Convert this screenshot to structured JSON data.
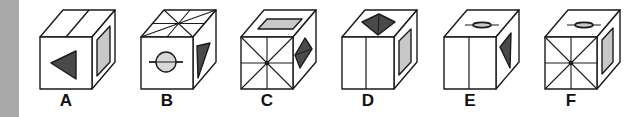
{
  "colors": {
    "stroke": "#1a1a1a",
    "face": "#ffffff",
    "dark_fill": "#4a4a4a",
    "light_fill": "#c8c8c8",
    "circle_fill": "#d8d8d8",
    "side_bar": "#a9a9a9"
  },
  "options": [
    {
      "label": "A",
      "front": "left-pointing dark triangle",
      "top": "single diagonal divider line",
      "right": "light gray rectangle"
    },
    {
      "label": "B",
      "front": "circle with horizontal line",
      "top": "8-way star lines",
      "right": "dark triangle"
    },
    {
      "label": "C",
      "front": "8-way star lines",
      "top": "light gray parallelogram",
      "right": "dark split diamond"
    },
    {
      "label": "D",
      "front": "vertical center divider",
      "top": "dark split diamond",
      "right": "light gray rectangle"
    },
    {
      "label": "E",
      "front": "vertical center divider",
      "top": "flat ellipse with line",
      "right": "dark triangle"
    },
    {
      "label": "F",
      "front": "8-way star lines",
      "top": "flat ellipse with line",
      "right": "light gray rectangle"
    }
  ]
}
